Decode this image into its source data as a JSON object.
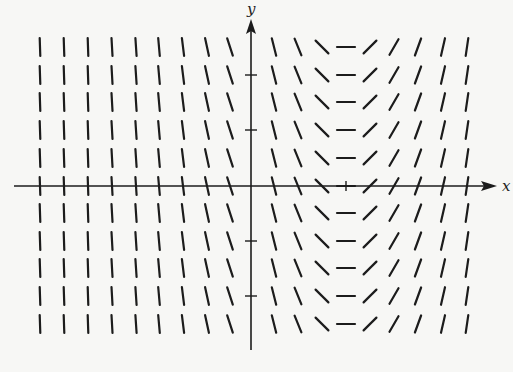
{
  "diagram": {
    "type": "slope_field",
    "axis_labels": {
      "x": "x",
      "y": "y"
    },
    "colors": {
      "ink": "#1c1c1c",
      "background": "#f7f7f5"
    },
    "origin_px": {
      "x": 251,
      "y": 186
    },
    "columns_px": [
      40,
      64,
      88,
      112,
      136,
      159,
      183,
      207,
      230,
      274,
      298,
      322,
      346,
      370,
      394,
      418,
      443,
      467
    ],
    "rows_px": [
      47,
      75,
      102,
      130,
      158,
      186,
      213,
      241,
      268,
      296,
      324
    ],
    "column_angles_deg": [
      88,
      88,
      88,
      87,
      86,
      85,
      83,
      78,
      72,
      76,
      68,
      45,
      0,
      -45,
      -60,
      -70,
      -77,
      -82
    ],
    "y_axis_ticks_px": [
      75,
      130,
      241,
      296
    ],
    "x_axis_ticks_px": [
      346
    ],
    "note": "Slopes depend only on x; zero slope at x column 346 (horizontal segments)."
  }
}
